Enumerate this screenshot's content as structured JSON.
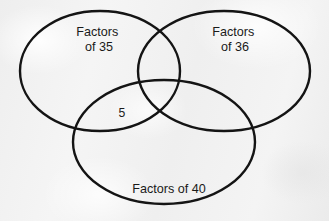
{
  "figure": {
    "type": "venn-diagram",
    "set_count": 3,
    "background_color": "#f1f1f1",
    "stroke_color": "#141414"
  },
  "sets": [
    {
      "id": "set-left",
      "name": "factors-of-35",
      "label_line1": "Factors",
      "label_line2": "of 35",
      "label_x": 99,
      "label_y": 36,
      "cx": 100,
      "cy": 71,
      "rx": 80,
      "ry": 60
    },
    {
      "id": "set-right",
      "name": "factors-of-36",
      "label_line1": "Factors",
      "label_line2": "of 36",
      "label_x": 235,
      "label_y": 36,
      "cx": 224,
      "cy": 71,
      "rx": 86,
      "ry": 60
    },
    {
      "id": "set-bottom",
      "name": "factors-of-40",
      "label_line1": "Factors of 40",
      "label_line2": "",
      "label_x": 169,
      "label_y": 193,
      "cx": 164,
      "cy": 142,
      "rx": 91,
      "ry": 62
    }
  ],
  "region_labels": [
    {
      "id": "region-left-bottom",
      "name": "left-bottom-intersection",
      "value": "5",
      "x": 122,
      "y": 117
    }
  ]
}
